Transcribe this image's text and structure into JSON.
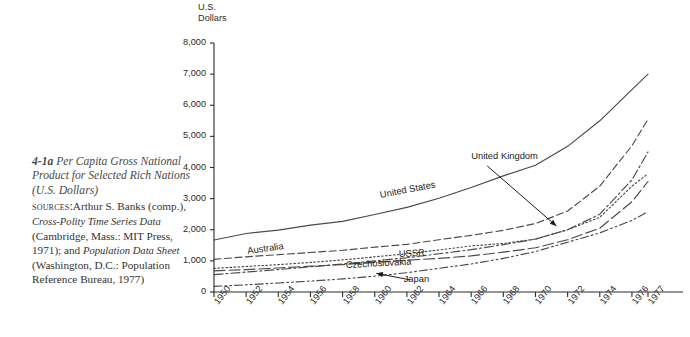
{
  "figure": {
    "number": "4-1a",
    "title": "Per Capita Gross National Product for Selected Rich Nations (U.S. Dollars)",
    "title_line1": "Per Capita Gross",
    "title_line2": "National Product for",
    "title_line3": "Selected Rich Nations",
    "title_line4": "(U.S. Dollars)",
    "sources_label": "sources:",
    "sources_text_1": "Arthur S. Banks (comp.), ",
    "sources_italic_1": "Cross-Polity Time Series Data",
    "sources_text_2": " (Cambridge, Mass.: MIT Press, 1971); and ",
    "sources_italic_2": "Population Data Sheet",
    "sources_text_3": " (Washington, D.C.: Population Reference Bureau, 1977)"
  },
  "chart_data": {
    "type": "line",
    "title": "Per Capita Gross National Product for Selected Rich Nations (U.S. Dollars)",
    "xlabel": "",
    "ylabel": "U.S. Dollars",
    "ylabel_lines": "U.S.\nDollars",
    "ylim": [
      0,
      8000
    ],
    "yticks": [
      0,
      1000,
      2000,
      3000,
      4000,
      5000,
      6000,
      7000,
      8000
    ],
    "ytick_labels": [
      "0",
      "1,000",
      "2,000",
      "3,000",
      "4,000",
      "5,000",
      "6,000",
      "7,000",
      "8,000"
    ],
    "grid": false,
    "legend": "inline-labels",
    "x": [
      1950,
      1952,
      1954,
      1956,
      1958,
      1960,
      1962,
      1964,
      1966,
      1968,
      1970,
      1972,
      1974,
      1976,
      1977
    ],
    "xtick_labels": [
      "1950",
      "1952",
      "1954",
      "1956",
      "1958",
      "1960",
      "1962",
      "1964",
      "1966",
      "1968",
      "1970",
      "1972",
      "1974",
      "1976",
      "1977"
    ],
    "series": [
      {
        "name": "United States",
        "style": "solid",
        "label_x": 1960.4,
        "label_y": 2980,
        "values": [
          1670,
          1880,
          1990,
          2150,
          2270,
          2490,
          2720,
          3010,
          3360,
          3730,
          4070,
          4680,
          5500,
          6500,
          7000
        ]
      },
      {
        "name": "United Kingdom",
        "style": "dotted",
        "label_x": 1966.0,
        "label_y": 4250,
        "annotation": "arrow",
        "values": [
          760,
          820,
          880,
          950,
          1030,
          1130,
          1230,
          1350,
          1480,
          1560,
          1700,
          2000,
          2400,
          3400,
          3800
        ]
      },
      {
        "name": "Australia",
        "style": "dashed",
        "label_x": 1952.1,
        "label_y": 1180,
        "values": [
          1050,
          1130,
          1200,
          1270,
          1340,
          1440,
          1530,
          1680,
          1820,
          1980,
          2200,
          2600,
          3400,
          4700,
          5550
        ]
      },
      {
        "name": "USSR",
        "style": "dash-dot",
        "label_x": 1961.5,
        "label_y": 1080,
        "values": [
          560,
          640,
          720,
          810,
          900,
          1000,
          1100,
          1230,
          1360,
          1520,
          1700,
          2000,
          2500,
          3600,
          4500
        ]
      },
      {
        "name": "Czechoslovakia",
        "style": "long-dash",
        "label_x": 1958.2,
        "label_y": 730,
        "values": [
          680,
          720,
          770,
          830,
          880,
          950,
          1020,
          1080,
          1160,
          1280,
          1420,
          1680,
          2050,
          2900,
          3550
        ]
      },
      {
        "name": "Japan",
        "style": "dash-dot-dot",
        "label_x": 1961.8,
        "label_y": 300,
        "annotation": "arrow",
        "values": [
          180,
          230,
          290,
          350,
          420,
          510,
          620,
          760,
          900,
          1080,
          1300,
          1600,
          1900,
          2300,
          2580
        ]
      }
    ]
  }
}
